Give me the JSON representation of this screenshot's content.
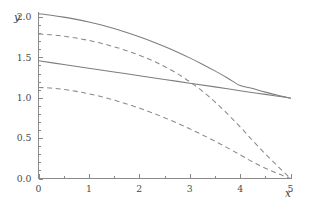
{
  "chart_data": {
    "type": "line",
    "title": "",
    "xlabel": "x",
    "ylabel": "y",
    "xlim": [
      0,
      5
    ],
    "ylim": [
      0,
      2.05
    ],
    "grid": false,
    "legend": null,
    "x_ticks": [
      0,
      1,
      2,
      3,
      4,
      5
    ],
    "x_tick_labels": [
      "0",
      "1",
      "2",
      "3",
      "4",
      "5"
    ],
    "x_minor_ticks": [
      0.5,
      1.5,
      2.5,
      3.5,
      4.5
    ],
    "y_ticks": [
      0.0,
      0.5,
      1.0,
      1.5,
      2.0
    ],
    "y_tick_labels": [
      "0.0",
      "0.5",
      "1.0",
      "1.5",
      "2.0"
    ],
    "y_minor_ticks": [
      0.1,
      0.2,
      0.3,
      0.4,
      0.6,
      0.7,
      0.8,
      0.9,
      1.1,
      1.2,
      1.3,
      1.4,
      1.6,
      1.7,
      1.8,
      1.9
    ],
    "line_color": "#808080",
    "series": [
      {
        "name": "upper-solid",
        "style": "solid",
        "x": [
          0,
          0.25,
          0.5,
          0.75,
          1,
          1.25,
          1.5,
          1.75,
          2,
          2.25,
          2.5,
          2.75,
          3,
          3.25,
          3.5,
          3.75,
          4,
          4.25,
          4.5,
          4.75,
          5
        ],
        "values": [
          2.04,
          2.022,
          1.999,
          1.971,
          1.938,
          1.9,
          1.857,
          1.809,
          1.756,
          1.698,
          1.635,
          1.567,
          1.494,
          1.416,
          1.333,
          1.245,
          1.152,
          1.114,
          1.07,
          1.03,
          0.995
        ]
      },
      {
        "name": "upper-dashed",
        "style": "dashed",
        "x": [
          0,
          0.25,
          0.5,
          0.75,
          1,
          1.25,
          1.5,
          1.75,
          2,
          2.25,
          2.5,
          2.75,
          3,
          3.25,
          3.5,
          3.75,
          4,
          4.25,
          4.5,
          4.75,
          5
        ],
        "values": [
          1.79,
          1.781,
          1.763,
          1.74,
          1.71,
          1.674,
          1.632,
          1.583,
          1.527,
          1.462,
          1.387,
          1.3,
          1.199,
          1.083,
          0.95,
          0.8,
          0.64,
          0.47,
          0.305,
          0.15,
          0.0
        ]
      },
      {
        "name": "lower-solid",
        "style": "solid",
        "x": [
          0,
          0.5,
          1,
          1.5,
          2,
          2.5,
          3,
          3.5,
          4,
          4.5,
          5
        ],
        "values": [
          1.458,
          1.412,
          1.366,
          1.32,
          1.273,
          1.227,
          1.181,
          1.135,
          1.088,
          1.042,
          0.996
        ]
      },
      {
        "name": "lower-dashed",
        "style": "dashed",
        "x": [
          0,
          0.25,
          0.5,
          0.75,
          1,
          1.25,
          1.5,
          1.75,
          2,
          2.25,
          2.5,
          2.75,
          3,
          3.25,
          3.5,
          3.75,
          4,
          4.25,
          4.5,
          4.75,
          5
        ],
        "values": [
          1.128,
          1.12,
          1.103,
          1.079,
          1.049,
          1.013,
          0.971,
          0.924,
          0.872,
          0.815,
          0.753,
          0.687,
          0.616,
          0.541,
          0.462,
          0.379,
          0.293,
          0.205,
          0.128,
          0.06,
          0.0
        ]
      }
    ]
  }
}
